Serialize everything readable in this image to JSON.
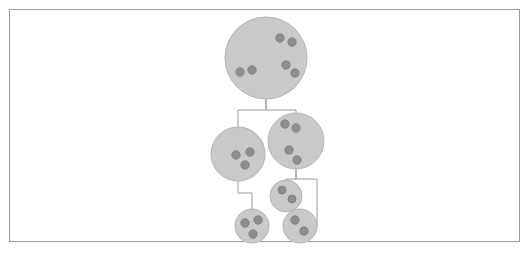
{
  "figure": {
    "canvas": {
      "width": 530,
      "height": 256
    },
    "colors": {
      "background": "#ffffff",
      "frame_stroke": "#9b9b9b",
      "cell_fill": "#c9c9c9",
      "cell_stroke": "#b3b3b3",
      "dot_fill": "#8e8e8e",
      "dot_stroke": "#7a7a7a",
      "connector_stroke": "#9a9a9a"
    },
    "frame": {
      "x": 9,
      "y": 9,
      "width": 511,
      "height": 233,
      "stroke_width": 1
    }
  },
  "chart_data": {
    "type": "diagram",
    "xlabel": "",
    "ylabel": "",
    "grid": false,
    "legend": "none",
    "node_count": 6,
    "edge_count": 5,
    "total_dots": 16,
    "nodes": [
      {
        "id": "root",
        "name": "root-cell",
        "level": 0,
        "cx": 266,
        "cy": 58,
        "r": 41,
        "dot_count": 6,
        "dot_radius": 4.2,
        "dots": [
          {
            "cx": 280,
            "cy": 38
          },
          {
            "cx": 292,
            "cy": 42
          },
          {
            "cx": 286,
            "cy": 65
          },
          {
            "cx": 295,
            "cy": 73
          },
          {
            "cx": 240,
            "cy": 72
          },
          {
            "cx": 252,
            "cy": 70
          },
          {
            "cx": 246,
            "cy": 81
          }
        ]
      },
      {
        "id": "mid-left",
        "name": "mid-left-cell",
        "level": 1,
        "cx": 238,
        "cy": 154,
        "r": 27,
        "dot_count": 3,
        "dot_radius": 4.2,
        "dots": [
          {
            "cx": 236,
            "cy": 155
          },
          {
            "cx": 250,
            "cy": 152
          },
          {
            "cx": 245,
            "cy": 165
          }
        ]
      },
      {
        "id": "mid-right",
        "name": "mid-right-cell",
        "level": 1,
        "cx": 296,
        "cy": 141,
        "r": 28,
        "dot_count": 4,
        "dot_radius": 4.2,
        "dots": [
          {
            "cx": 285,
            "cy": 124
          },
          {
            "cx": 296,
            "cy": 128
          },
          {
            "cx": 289,
            "cy": 150
          },
          {
            "cx": 297,
            "cy": 160
          }
        ]
      },
      {
        "id": "small-upper-right",
        "name": "small-upper-right-cell",
        "level": 2,
        "cx": 286,
        "cy": 196,
        "r": 16,
        "dot_count": 2,
        "dot_radius": 4.0,
        "dots": [
          {
            "cx": 282,
            "cy": 190
          },
          {
            "cx": 292,
            "cy": 199
          }
        ]
      },
      {
        "id": "small-bottom-left",
        "name": "small-bottom-left-cell",
        "level": 3,
        "cx": 252,
        "cy": 226,
        "r": 17,
        "dot_count": 3,
        "dot_radius": 4.2,
        "dots": [
          {
            "cx": 245,
            "cy": 223
          },
          {
            "cx": 258,
            "cy": 220
          },
          {
            "cx": 253,
            "cy": 234
          }
        ]
      },
      {
        "id": "small-bottom-right",
        "name": "small-bottom-right-cell",
        "level": 3,
        "cx": 300,
        "cy": 226,
        "r": 17,
        "dot_count": 2,
        "dot_radius": 4.2,
        "dots": [
          {
            "cx": 295,
            "cy": 220
          },
          {
            "cx": 304,
            "cy": 231
          }
        ]
      }
    ],
    "edges": [
      {
        "id": "edge-root-split",
        "name": "connector-root-to-mid",
        "from": "root",
        "to": "mid-left,mid-right",
        "points": "266,99 266,110 238,110 238,127 266,110 296,110 296,113"
      },
      {
        "id": "edge-midleft-to-bottomleft",
        "name": "connector-mid-left-to-small-bottom-left",
        "from": "mid-left",
        "to": "small-bottom-left",
        "points": "238,181 238,193 252,193 252,209"
      },
      {
        "id": "edge-midright-split",
        "name": "connector-mid-right-to-children",
        "from": "mid-right",
        "to": "small-upper-right,small-bottom-right",
        "points": "296,169 296,179 286,179 286,180 296,179 317,179 317,226 317,226"
      }
    ]
  }
}
